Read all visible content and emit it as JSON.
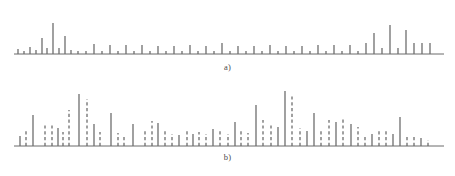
{
  "figure": {
    "background_color": "#ffffff",
    "stem_color": "#6e6e6e",
    "axis_color": "#6b6b6b",
    "label_color": "#4a4a4a"
  },
  "panels": [
    {
      "id": "a",
      "label": "a)",
      "axis": {
        "x_start": 14,
        "x_end": 444,
        "baseline_y": 54
      }
    },
    {
      "id": "b",
      "label": "b)",
      "axis": {
        "x_start": 14,
        "x_end": 444,
        "baseline_y": 58
      }
    }
  ],
  "chart_data": [
    {
      "type": "bar",
      "id": "panel-a",
      "title": "a)",
      "xlabel": "",
      "ylabel": "",
      "grid": false,
      "legend": null,
      "axis_range": {
        "xlim": [
          14,
          444
        ],
        "ylim": [
          0,
          48
        ]
      },
      "style": "stem plot, all solid vertical lines on a horizontal baseline",
      "x": [
        18,
        24,
        30,
        36,
        42,
        47,
        53,
        59,
        65,
        71,
        78,
        86,
        94,
        102,
        110,
        118,
        126,
        134,
        142,
        150,
        158,
        166,
        174,
        182,
        190,
        198,
        206,
        214,
        222,
        230,
        238,
        246,
        254,
        262,
        270,
        278,
        286,
        294,
        302,
        310,
        318,
        326,
        334,
        342,
        350,
        358,
        366,
        374,
        382,
        390,
        398,
        406,
        414,
        422,
        430
      ],
      "values": [
        5,
        3,
        7,
        4,
        16,
        6,
        31,
        6,
        18,
        4,
        3,
        3,
        10,
        3,
        9,
        3,
        9,
        3,
        9,
        3,
        8,
        3,
        8,
        3,
        9,
        3,
        8,
        3,
        11,
        3,
        8,
        3,
        8,
        3,
        9,
        3,
        8,
        3,
        8,
        3,
        9,
        3,
        9,
        3,
        9,
        3,
        11,
        21,
        6,
        29,
        6,
        24,
        11,
        11,
        11
      ],
      "linestyles": [
        "solid",
        "solid",
        "solid",
        "solid",
        "solid",
        "solid",
        "solid",
        "solid",
        "solid",
        "solid",
        "solid",
        "solid",
        "solid",
        "solid",
        "solid",
        "solid",
        "solid",
        "solid",
        "solid",
        "solid",
        "solid",
        "solid",
        "solid",
        "solid",
        "solid",
        "solid",
        "solid",
        "solid",
        "solid",
        "solid",
        "solid",
        "solid",
        "solid",
        "solid",
        "solid",
        "solid",
        "solid",
        "solid",
        "solid",
        "solid",
        "solid",
        "solid",
        "solid",
        "solid",
        "solid",
        "solid",
        "solid",
        "solid",
        "solid",
        "solid",
        "solid",
        "solid",
        "solid",
        "solid",
        "solid"
      ]
    },
    {
      "type": "bar",
      "id": "panel-b",
      "title": "b)",
      "xlabel": "",
      "ylabel": "",
      "grid": false,
      "legend": null,
      "axis_range": {
        "xlim": [
          14,
          444
        ],
        "ylim": [
          0,
          58
        ]
      },
      "style": "stem plot, interleaved solid and dashed vertical lines on a horizontal baseline",
      "x": [
        20,
        26,
        33,
        45,
        52,
        58,
        63,
        69,
        79,
        87,
        94,
        100,
        111,
        118,
        124,
        133,
        145,
        152,
        158,
        165,
        172,
        179,
        187,
        193,
        199,
        206,
        213,
        220,
        228,
        235,
        241,
        248,
        256,
        263,
        271,
        278,
        285,
        292,
        300,
        307,
        314,
        321,
        329,
        336,
        343,
        351,
        358,
        365,
        372,
        379,
        386,
        393,
        400,
        407,
        414,
        421,
        428
      ],
      "values": [
        10,
        17,
        31,
        23,
        21,
        18,
        14,
        36,
        52,
        47,
        22,
        14,
        33,
        13,
        10,
        22,
        17,
        25,
        23,
        15,
        12,
        11,
        16,
        12,
        14,
        12,
        17,
        16,
        12,
        24,
        17,
        13,
        41,
        26,
        22,
        19,
        55,
        52,
        18,
        15,
        33,
        16,
        26,
        24,
        28,
        22,
        19,
        11,
        12,
        15,
        15,
        12,
        29,
        10,
        9,
        8,
        6
      ],
      "linestyles": [
        "solid",
        "dashed",
        "solid",
        "dashed",
        "dashed",
        "solid",
        "dashed",
        "dashed",
        "solid",
        "dashed",
        "solid",
        "dashed",
        "solid",
        "dashed",
        "dashed",
        "solid",
        "dashed",
        "dashed",
        "solid",
        "dashed",
        "dashed",
        "solid",
        "dashed",
        "solid",
        "dashed",
        "dashed",
        "solid",
        "dashed",
        "dashed",
        "solid",
        "dashed",
        "dashed",
        "solid",
        "dashed",
        "dashed",
        "solid",
        "solid",
        "dashed",
        "dashed",
        "solid",
        "solid",
        "dashed",
        "dashed",
        "solid",
        "dashed",
        "solid",
        "dashed",
        "dashed",
        "solid",
        "dashed",
        "dashed",
        "solid",
        "solid",
        "dashed",
        "dashed",
        "solid",
        "dashed"
      ]
    }
  ]
}
